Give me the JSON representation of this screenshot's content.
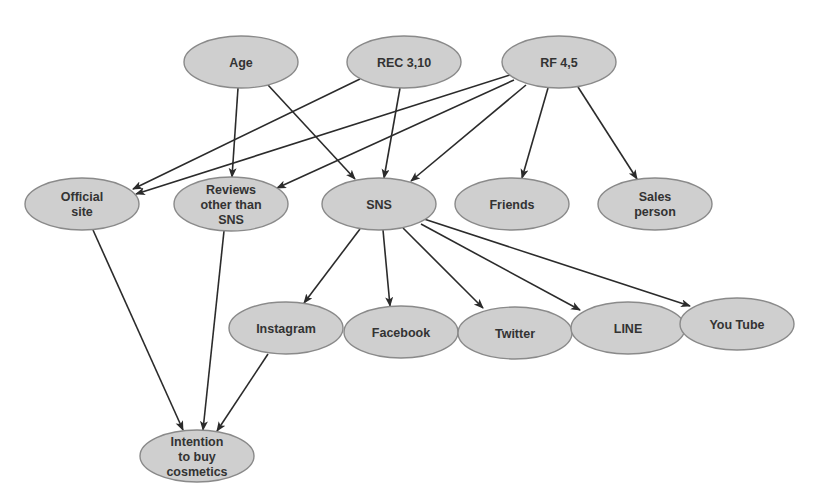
{
  "colors": {
    "node_fill": "#cfcfcf",
    "node_stroke": "#8a8a8a",
    "edge": "#2b2b2b",
    "text": "#333333",
    "background": "#ffffff"
  },
  "nodes": [
    {
      "id": "age",
      "lines": [
        "Age"
      ],
      "cx": 241,
      "cy": 62,
      "rx": 57,
      "ry": 26
    },
    {
      "id": "rec",
      "lines": [
        "REC 3,10"
      ],
      "cx": 404,
      "cy": 62,
      "rx": 57,
      "ry": 26
    },
    {
      "id": "rf",
      "lines": [
        "RF 4,5"
      ],
      "cx": 559,
      "cy": 62,
      "rx": 57,
      "ry": 26
    },
    {
      "id": "official",
      "lines": [
        "Official",
        "site"
      ],
      "cx": 82,
      "cy": 204,
      "rx": 57,
      "ry": 26
    },
    {
      "id": "reviews",
      "lines": [
        "Reviews",
        "other than",
        "SNS"
      ],
      "cx": 231,
      "cy": 204,
      "rx": 57,
      "ry": 27
    },
    {
      "id": "sns",
      "lines": [
        "SNS"
      ],
      "cx": 379,
      "cy": 204,
      "rx": 57,
      "ry": 26
    },
    {
      "id": "friends",
      "lines": [
        "Friends"
      ],
      "cx": 512,
      "cy": 204,
      "rx": 57,
      "ry": 26
    },
    {
      "id": "sales",
      "lines": [
        "Sales",
        "person"
      ],
      "cx": 655,
      "cy": 204,
      "rx": 57,
      "ry": 26
    },
    {
      "id": "instagram",
      "lines": [
        "Instagram"
      ],
      "cx": 286,
      "cy": 328,
      "rx": 57,
      "ry": 26
    },
    {
      "id": "facebook",
      "lines": [
        "Facebook"
      ],
      "cx": 401,
      "cy": 332,
      "rx": 57,
      "ry": 26
    },
    {
      "id": "twitter",
      "lines": [
        "Twitter"
      ],
      "cx": 515,
      "cy": 333,
      "rx": 57,
      "ry": 26
    },
    {
      "id": "line",
      "lines": [
        "LINE"
      ],
      "cx": 628,
      "cy": 328,
      "rx": 57,
      "ry": 26
    },
    {
      "id": "youtube",
      "lines": [
        "You Tube"
      ],
      "cx": 737,
      "cy": 324,
      "rx": 57,
      "ry": 26
    },
    {
      "id": "intention",
      "lines": [
        "Intention",
        "to buy",
        "cosmetics"
      ],
      "cx": 197,
      "cy": 456,
      "rx": 57,
      "ry": 26
    }
  ],
  "edges": [
    {
      "from": "age",
      "to": "reviews",
      "x1": 238,
      "y1": 88,
      "x2": 232,
      "y2": 177
    },
    {
      "from": "age",
      "to": "sns",
      "x1": 268,
      "y1": 85,
      "x2": 355,
      "y2": 179
    },
    {
      "from": "rec",
      "to": "official",
      "x1": 360,
      "y1": 79,
      "x2": 133,
      "y2": 189
    },
    {
      "from": "rec",
      "to": "sns",
      "x1": 400,
      "y1": 88,
      "x2": 384,
      "y2": 178
    },
    {
      "from": "rf",
      "to": "official",
      "x1": 510,
      "y1": 75,
      "x2": 136,
      "y2": 194
    },
    {
      "from": "rf",
      "to": "reviews",
      "x1": 514,
      "y1": 80,
      "x2": 277,
      "y2": 188
    },
    {
      "from": "rf",
      "to": "sns",
      "x1": 526,
      "y1": 85,
      "x2": 411,
      "y2": 181
    },
    {
      "from": "rf",
      "to": "friends",
      "x1": 548,
      "y1": 88,
      "x2": 522,
      "y2": 178
    },
    {
      "from": "rf",
      "to": "sales",
      "x1": 578,
      "y1": 87,
      "x2": 637,
      "y2": 179
    },
    {
      "from": "sns",
      "to": "instagram",
      "x1": 360,
      "y1": 229,
      "x2": 304,
      "y2": 303
    },
    {
      "from": "sns",
      "to": "facebook",
      "x1": 383,
      "y1": 230,
      "x2": 390,
      "y2": 306
    },
    {
      "from": "sns",
      "to": "twitter",
      "x1": 403,
      "y1": 228,
      "x2": 483,
      "y2": 308
    },
    {
      "from": "sns",
      "to": "line",
      "x1": 421,
      "y1": 224,
      "x2": 580,
      "y2": 310
    },
    {
      "from": "sns",
      "to": "youtube",
      "x1": 424,
      "y1": 219,
      "x2": 690,
      "y2": 306
    },
    {
      "from": "official",
      "to": "intention",
      "x1": 93,
      "y1": 230,
      "x2": 183,
      "y2": 430
    },
    {
      "from": "reviews",
      "to": "intention",
      "x1": 224,
      "y1": 231,
      "x2": 203,
      "y2": 430
    },
    {
      "from": "instagram",
      "to": "intention",
      "x1": 268,
      "y1": 354,
      "x2": 217,
      "y2": 431
    }
  ]
}
